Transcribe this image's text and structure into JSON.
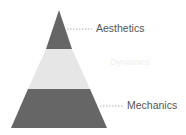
{
  "diagram": {
    "type": "pyramid",
    "layers": [
      {
        "label": "Aesthetics",
        "color": "#666666",
        "label_color": "#555555"
      },
      {
        "label": "Dynamics",
        "color": "#e6e6e6",
        "label_color": "#eeeeee"
      },
      {
        "label": "Mechanics",
        "color": "#666666",
        "label_color": "#555555"
      }
    ],
    "connector_color": "#b0b0b0"
  }
}
